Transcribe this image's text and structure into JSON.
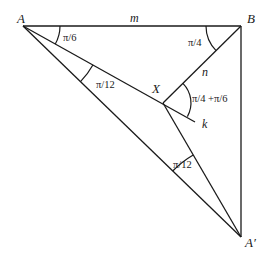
{
  "diagram": {
    "points": {
      "A": {
        "label": "A",
        "x": 23,
        "y": 26
      },
      "B": {
        "label": "B",
        "x": 241,
        "y": 26
      },
      "X": {
        "label": "X",
        "x": 163,
        "y": 103
      },
      "A_prime": {
        "label": "A′",
        "x": 241,
        "y": 237
      },
      "k_end": {
        "label": "k",
        "x": 195,
        "y": 122
      }
    },
    "segments": [
      {
        "from": "A",
        "to": "B",
        "label": "m"
      },
      {
        "from": "B",
        "to": "X",
        "label": "n"
      },
      {
        "from": "A",
        "to": "k_end",
        "label": "k"
      },
      {
        "from": "B",
        "to": "A_prime",
        "label": ""
      },
      {
        "from": "A",
        "to": "A_prime",
        "label": ""
      },
      {
        "from": "X",
        "to": "A_prime",
        "label": ""
      }
    ],
    "angles": {
      "at_A_top": "π/6",
      "at_A_middle": "π/12",
      "at_B": "π/4",
      "at_X": "π/4 +π/6",
      "at_A_prime": "π/12"
    },
    "labels": {
      "A": "A",
      "B": "B",
      "X": "X",
      "A_prime": "A′",
      "m": "m",
      "n": "n",
      "k": "k"
    },
    "stroke_color": "#1a1a1a"
  }
}
